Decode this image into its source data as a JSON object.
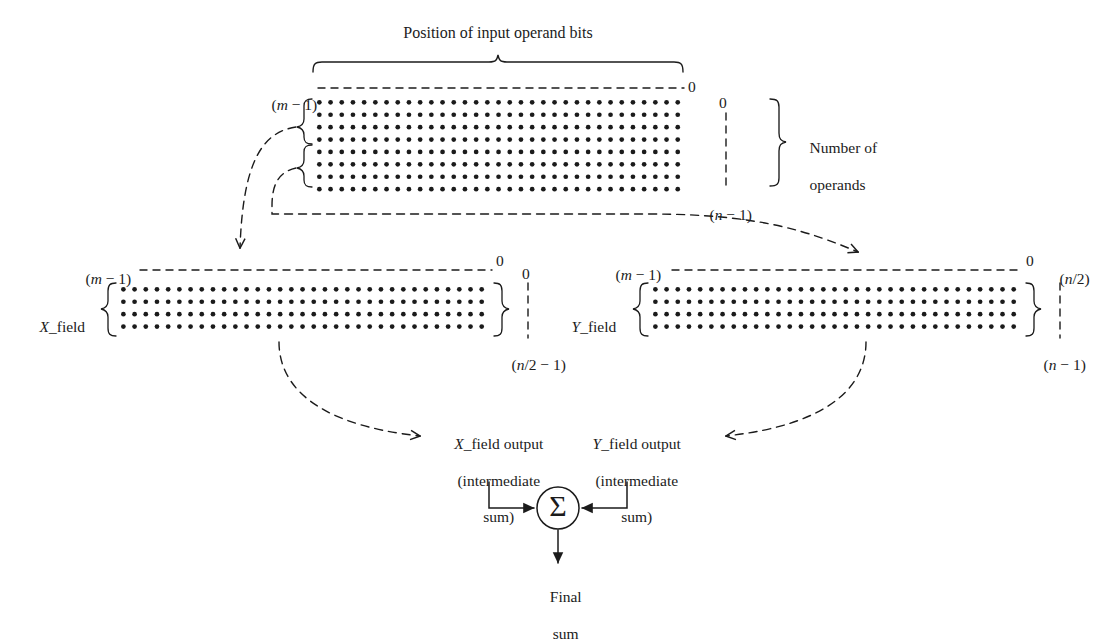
{
  "figure": {
    "type": "diagram",
    "background_color": "#ffffff",
    "ink_color": "#1b1b1b"
  },
  "labels": {
    "title": "Position of input operand bits",
    "main_msb": "(m − 1)",
    "main_lsb": "0",
    "main_row_first": "0",
    "main_row_last": "(n − 1)",
    "operands_brace": "Number of\noperands",
    "operands_brace_line1": "Number of",
    "operands_brace_line2": "operands",
    "x_field_name": "X_field",
    "x_field_msb": "(m − 1)",
    "x_field_lsb": "0",
    "x_field_row_first": "0",
    "x_field_row_last": "(n/2 − 1)",
    "y_field_name": "Y_field",
    "y_field_msb": "(m − 1)",
    "y_field_lsb": "0",
    "y_field_row_first": "(n/2)",
    "y_field_row_last": "(n − 1)",
    "x_output_line1": "X_field output",
    "x_output_line2": "(intermediate",
    "x_output_line3": "sum)",
    "y_output_line1": "Y_field output",
    "y_output_line2": "(intermediate",
    "y_output_line3": "sum)",
    "adder_symbol": "Σ",
    "final_line1": "Final",
    "final_line2": "sum"
  },
  "chart_data": {
    "type": "diagram",
    "arrays": [
      {
        "id": "main-array",
        "name": "input operand dot matrix",
        "rows": 8,
        "cols": 33,
        "msb_label": "(m − 1)",
        "lsb_label": "0",
        "first_row_label": "0",
        "last_row_label": "(n − 1)"
      },
      {
        "id": "x-field-array",
        "name": "X_field dot matrix",
        "rows": 4,
        "cols": 33,
        "msb_label": "(m − 1)",
        "lsb_label": "0",
        "first_row_label": "0",
        "last_row_label": "(n/2 − 1)"
      },
      {
        "id": "y-field-array",
        "name": "Y_field dot matrix",
        "rows": 4,
        "cols": 33,
        "msb_label": "(m − 1)",
        "lsb_label": "0",
        "first_row_label": "(n/2)",
        "last_row_label": "(n − 1)"
      }
    ],
    "flows": [
      {
        "from": "main-array upper half",
        "to": "X_field",
        "style": "dashed-curved-arrow"
      },
      {
        "from": "main-array lower half",
        "to": "Y_field",
        "style": "dashed-curved-arrow"
      },
      {
        "from": "X_field",
        "to": "X_field output (intermediate sum)",
        "style": "dashed-curved-arrow"
      },
      {
        "from": "Y_field",
        "to": "Y_field output (intermediate sum)",
        "style": "dashed-curved-arrow"
      },
      {
        "from": "X_field output",
        "to": "adder",
        "style": "solid-arrow"
      },
      {
        "from": "Y_field output",
        "to": "adder",
        "style": "solid-arrow"
      },
      {
        "from": "adder",
        "to": "Final sum",
        "style": "solid-arrow"
      }
    ]
  }
}
